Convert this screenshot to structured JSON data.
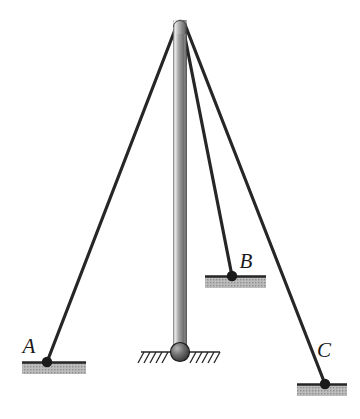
{
  "figure": {
    "background_color": "#ffffff",
    "line_color": "#262626",
    "support_fill": "#b5b5b5",
    "pole_light": "#f2f2f2",
    "pole_mid": "#8c8c8c",
    "pole_dark": "#4d4d4d"
  },
  "pole": {
    "name": "vertical-pole",
    "top_x": 180,
    "top_y": 20,
    "base_x": 180,
    "base_y": 352,
    "width": 13,
    "cap_radius": 6.5
  },
  "base_joint": {
    "name": "ball-and-socket-base",
    "center_x": 180,
    "center_y": 352,
    "radius": 9
  },
  "ground": {
    "name": "ground-hatching",
    "line_y": 352,
    "x_start": 141,
    "x_end": 220,
    "hatch_count": 13,
    "hatch_length": 12
  },
  "cables": [
    {
      "name": "cable-to-a",
      "label": "A",
      "from_x": 178,
      "from_y": 22,
      "to_x": 47,
      "to_y": 362
    },
    {
      "name": "cable-to-b",
      "label": "B",
      "from_x": 182,
      "from_y": 22,
      "to_x": 232,
      "to_y": 276
    },
    {
      "name": "cable-to-c",
      "label": "C",
      "from_x": 184,
      "from_y": 22,
      "to_x": 325,
      "to_y": 384
    }
  ],
  "supports": [
    {
      "name": "support-a",
      "label": "A",
      "anchor_x": 47,
      "anchor_y": 362,
      "line_y": 362,
      "x_start": 22,
      "x_end": 86,
      "block_height": 11,
      "label_x": 31,
      "label_y": 352
    },
    {
      "name": "support-b",
      "label": "B",
      "anchor_x": 232,
      "anchor_y": 276,
      "line_y": 276,
      "x_start": 205,
      "x_end": 266,
      "block_height": 11,
      "label_x": 240,
      "label_y": 267
    },
    {
      "name": "support-c",
      "label": "C",
      "anchor_x": 325,
      "anchor_y": 384,
      "line_y": 384,
      "x_start": 297,
      "x_end": 347,
      "block_height": 11,
      "label_x": 316,
      "label_y": 356
    }
  ],
  "anchor_dots": [
    {
      "name": "anchor-dot-a",
      "cx": 47,
      "cy": 362,
      "r": 5
    },
    {
      "name": "anchor-dot-b",
      "cx": 232,
      "cy": 276,
      "r": 5
    },
    {
      "name": "anchor-dot-c",
      "cx": 325,
      "cy": 384,
      "r": 5
    }
  ],
  "labels": {
    "a": "A",
    "b": "B",
    "c": "C"
  }
}
